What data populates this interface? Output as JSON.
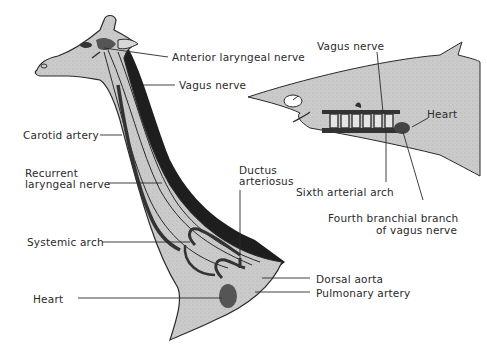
{
  "figure": {
    "giraffe": {
      "labels": {
        "anterior_laryngeal_nerve": "Anterior laryngeal nerve",
        "vagus_nerve": "Vagus nerve",
        "carotid_artery": "Carotid artery",
        "recurrent_line1": "Recurrent",
        "recurrent_line2": "laryngeal nerve",
        "ductus_line1": "Ductus",
        "ductus_line2": "arteriosus",
        "systemic_arch": "Systemic arch",
        "dorsal_aorta": "Dorsal aorta",
        "pulmonary_artery": "Pulmonary artery",
        "heart": "Heart"
      }
    },
    "shark": {
      "labels": {
        "vagus_nerve": "Vagus nerve",
        "heart": "Heart",
        "sixth_arterial_arch": "Sixth arterial arch",
        "fourth_branch_line1": "Fourth branchial branch",
        "fourth_branch_line2": "of vagus nerve"
      }
    },
    "colors": {
      "body_fill": "#c9c9c9",
      "outline": "#2a2a2a",
      "vessel": "#3a3a3a",
      "mane": "#1e1e1e",
      "label_text": "#2a2a2a"
    }
  }
}
